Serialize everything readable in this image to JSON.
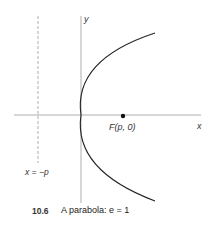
{
  "figure": {
    "axes": {
      "x_label": "x",
      "y_label": "y"
    },
    "directrix": {
      "label": "x = −p"
    },
    "focus": {
      "label": "F(p, 0)"
    },
    "caption": {
      "number": "10.6",
      "text": "A parabola: e = 1"
    },
    "colors": {
      "axis": "#999999",
      "curve": "#222222",
      "directrix": "#999999",
      "focus": "#111111"
    }
  }
}
